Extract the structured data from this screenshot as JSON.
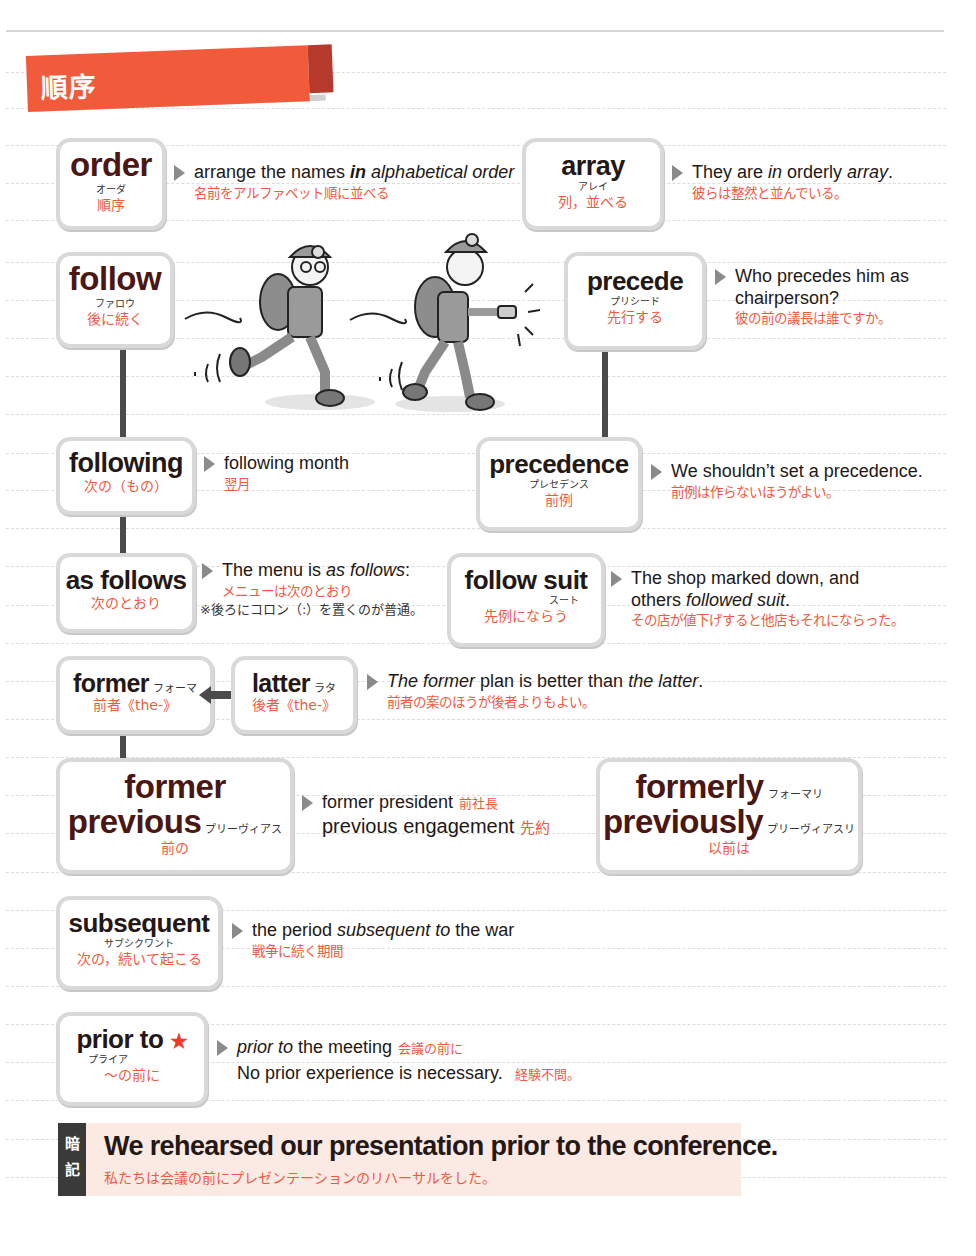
{
  "section": {
    "title": "順序",
    "color": "#f15a3a",
    "accent": "#b53a2c"
  },
  "entries": {
    "order": {
      "word": "order",
      "kana": "オーダ",
      "meaning": "順序",
      "example": {
        "pre": "arrange the names ",
        "bold": "in",
        "italic": " alphabetical order",
        "jp": "名前をアルファベット順に並べる"
      }
    },
    "array": {
      "word": "array",
      "kana": "アレイ",
      "meaning": "列，並べる",
      "example": {
        "pre": "They are ",
        "i1": "in",
        "mid": " orderly ",
        "i2": "array",
        "post": ".",
        "jp": "彼らは整然と並んでいる。"
      }
    },
    "follow": {
      "word": "follow",
      "kana": "ファロウ",
      "meaning": "後に続く"
    },
    "precede": {
      "word": "precede",
      "kana": "プリシード",
      "meaning": "先行する",
      "example": {
        "line1": "Who precedes him as",
        "line2": "chairperson?",
        "jp": "彼の前の議長は誰ですか。"
      }
    },
    "following": {
      "word": "following",
      "meaning": "次の（もの）",
      "example": {
        "text": "following month",
        "jp": "翌月"
      }
    },
    "precedence": {
      "word": "precedence",
      "kana": "プレセデンス",
      "meaning": "前例",
      "example": {
        "text": "We shouldn’t set a precedence.",
        "jp": "前例は作らないほうがよい。"
      }
    },
    "as_follows": {
      "word": "as follows",
      "meaning": "次のとおり",
      "example": {
        "pre": "The menu is ",
        "italic": "as follows",
        "post": ":",
        "jp": "メニューは次のとおり",
        "note": "※後ろにコロン（:）を置くのが普通。"
      }
    },
    "follow_suit": {
      "word": "follow suit",
      "kana": "スート",
      "meaning": "先例にならう",
      "example": {
        "line1": "The shop marked down, and",
        "line2_pre": "others ",
        "line2_italic": "followed suit",
        "line2_post": ".",
        "jp": "その店が値下げすると他店もそれにならった。"
      }
    },
    "former": {
      "word": "former",
      "kana": "フォーマ",
      "meaning": "前者《the-》"
    },
    "latter": {
      "word": "latter",
      "kana": "ラタ",
      "meaning": "後者《the-》",
      "example": {
        "i1": "The former",
        "mid": " plan is better than ",
        "i2": "the latter",
        "post": ".",
        "jp": "前者の案のほうが後者よりもよい。"
      }
    },
    "former_previous": {
      "word1": "former",
      "word2": "previous",
      "kana2": "プリーヴィアス",
      "meaning": "前の",
      "example": {
        "line1": "former president",
        "jp1": "前社長",
        "line2": "previous engagement",
        "jp2": "先約"
      }
    },
    "formerly_previously": {
      "word1": "formerly",
      "kana1": "フォーマリ",
      "word2": "previously",
      "kana2": "プリーヴィアスリ",
      "meaning": "以前は"
    },
    "subsequent": {
      "word": "subsequent",
      "kana": "サブシクワント",
      "meaning": "次の，続いて起こる",
      "example": {
        "pre": "the period ",
        "italic": "subsequent to",
        "post": " the war",
        "jp": "戦争に続く期間"
      }
    },
    "prior_to": {
      "word": "prior to",
      "star": "★",
      "kana": "プライア",
      "meaning": "～の前に",
      "example": {
        "italic": "prior to",
        "post": " the meeting",
        "jp1": "会議の前に",
        "line2": "No prior experience is necessary.",
        "jp2": "経験不問。"
      }
    }
  },
  "memo": {
    "tag1": "暗",
    "tag2": "記",
    "sentence": "We rehearsed our presentation prior to the conference.",
    "translation": "私たちは会議の前にプレゼンテーションのリハーサルをした。"
  }
}
